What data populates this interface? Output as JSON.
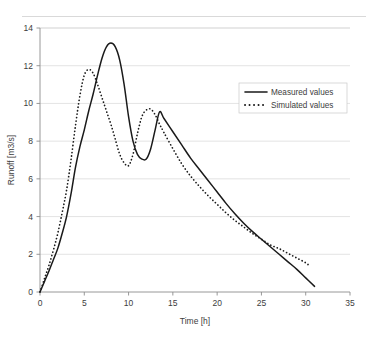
{
  "chart_data": {
    "type": "line",
    "title": "",
    "xlabel": "Time [h]",
    "ylabel": "Runoff [m3/s]",
    "xlim": [
      0,
      35
    ],
    "ylim": [
      0,
      14
    ],
    "xticks": [
      0,
      5,
      10,
      15,
      20,
      25,
      30,
      35
    ],
    "yticks": [
      0,
      2,
      4,
      6,
      8,
      10,
      12,
      14
    ],
    "grid": "horizontal",
    "legend_position": "upper-right",
    "series": [
      {
        "name": "Measured values",
        "style": "solid",
        "color": "#1a1a1a",
        "x": [
          0,
          0.5,
          1,
          1.5,
          2,
          2.5,
          3,
          3.5,
          4,
          4.5,
          5,
          5.5,
          6,
          6.5,
          7,
          7.5,
          8,
          8.5,
          9,
          9.5,
          10,
          10.5,
          11,
          11.5,
          12,
          12.5,
          13,
          13.5,
          14,
          15,
          16,
          17,
          18,
          19,
          20,
          21,
          22,
          23,
          24,
          25,
          26,
          27,
          28,
          29,
          30,
          31
        ],
        "y": [
          0.0,
          0.55,
          1.1,
          1.7,
          2.3,
          3.1,
          4.0,
          5.2,
          6.6,
          7.7,
          8.6,
          9.6,
          10.5,
          11.5,
          12.4,
          13.0,
          13.2,
          13.0,
          12.3,
          11.0,
          9.3,
          8.0,
          7.3,
          7.05,
          7.05,
          7.6,
          8.6,
          9.55,
          9.2,
          8.5,
          7.8,
          7.1,
          6.5,
          5.9,
          5.3,
          4.7,
          4.15,
          3.65,
          3.2,
          2.8,
          2.4,
          2.0,
          1.6,
          1.2,
          0.75,
          0.3
        ]
      },
      {
        "name": "Simulated values",
        "style": "dotted",
        "color": "#1a1a1a",
        "x": [
          0,
          0.5,
          1,
          1.5,
          2,
          2.5,
          3,
          3.5,
          4,
          4.5,
          5,
          5.5,
          6,
          6.5,
          7,
          7.5,
          8,
          8.5,
          9,
          9.5,
          10,
          10.5,
          11,
          11.5,
          12,
          12.5,
          13,
          13.5,
          14,
          15,
          16,
          17,
          18,
          19,
          20,
          21,
          22,
          23,
          24,
          25,
          26,
          27,
          28,
          29,
          30,
          30.5
        ],
        "y": [
          0.0,
          0.7,
          1.4,
          2.2,
          3.1,
          4.2,
          5.4,
          7.0,
          8.8,
          10.4,
          11.5,
          11.8,
          11.6,
          11.0,
          10.3,
          9.6,
          8.9,
          8.1,
          7.3,
          6.85,
          6.7,
          7.3,
          8.4,
          9.3,
          9.65,
          9.7,
          9.4,
          8.9,
          8.45,
          7.6,
          6.8,
          6.15,
          5.6,
          5.1,
          4.65,
          4.2,
          3.8,
          3.45,
          3.1,
          2.8,
          2.5,
          2.3,
          2.05,
          1.8,
          1.55,
          1.35
        ]
      }
    ]
  },
  "legend": {
    "items": [
      {
        "label": "Measured values",
        "style": "solid"
      },
      {
        "label": "Simulated values",
        "style": "dotted"
      }
    ]
  }
}
